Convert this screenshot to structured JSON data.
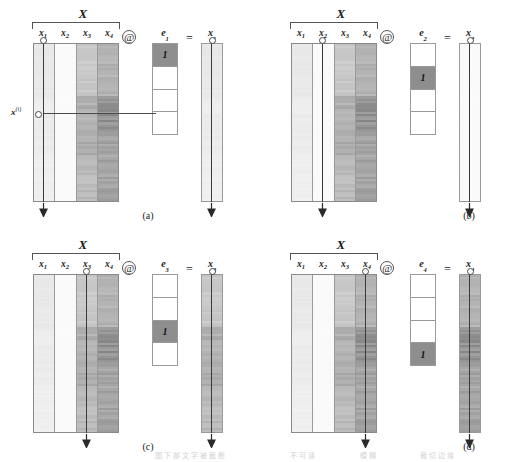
{
  "figure": {
    "matrix_label": "X",
    "operator_at": "@",
    "operator_eq": "=",
    "row_indicator_label": "x",
    "row_indicator_superscript": "(i)",
    "column_labels": [
      {
        "base": "x",
        "sub": "1"
      },
      {
        "base": "x",
        "sub": "2"
      },
      {
        "base": "x",
        "sub": "3"
      },
      {
        "base": "x",
        "sub": "4"
      }
    ],
    "one_value": "1"
  },
  "panels": [
    {
      "id": "a",
      "caption": "(a)",
      "selected_column_index": 1,
      "e_label_base": "e",
      "e_label_sub": "1",
      "result_label_base": "x",
      "result_label_sub": "1",
      "e_cells": [
        "1",
        "",
        "",
        ""
      ],
      "e_on_index": 1,
      "has_row_indicator": true
    },
    {
      "id": "b",
      "caption": "(b)",
      "selected_column_index": 2,
      "e_label_base": "e",
      "e_label_sub": "2",
      "result_label_base": "x",
      "result_label_sub": "2",
      "e_cells": [
        "",
        "1",
        "",
        ""
      ],
      "e_on_index": 2,
      "has_row_indicator": false
    },
    {
      "id": "c",
      "caption": "(c)",
      "selected_column_index": 3,
      "e_label_base": "e",
      "e_label_sub": "3",
      "result_label_base": "x",
      "result_label_sub": "3",
      "e_cells": [
        "",
        "",
        "1",
        ""
      ],
      "e_on_index": 3,
      "has_row_indicator": false
    },
    {
      "id": "d",
      "caption": "(d)",
      "selected_column_index": 4,
      "e_label_base": "e",
      "e_label_sub": "4",
      "result_label_base": "x",
      "result_label_sub": "4",
      "e_cells": [
        "",
        "",
        "",
        "1"
      ],
      "e_on_index": 4,
      "has_row_indicator": true
    }
  ],
  "colors": {
    "column_base": [
      "#ededed",
      "#fafafa",
      "#c3c3c3",
      "#a8a8a8"
    ],
    "highlight_cell": "#8e8e8e",
    "border": "#9a9a9a",
    "line": "#3a3a3a",
    "background": "#ffffff"
  },
  "footnote": {
    "part_a": "图下部文字被截断",
    "part_b": "不可读",
    "part_c": "模糊",
    "part_d": "裁切边缘"
  }
}
